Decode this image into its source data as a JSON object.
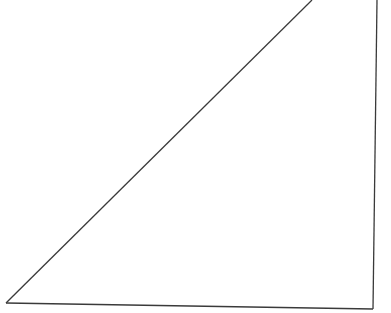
{
  "diagram": {
    "type": "triangle",
    "background": "#ffffff",
    "stroke_color": "#3a3a3a",
    "stroke_width": 1.3,
    "fill": "none",
    "vertices": {
      "apex_clipped_top_left": [
        312,
        0
      ],
      "apex_clipped_top_right": [
        377,
        0
      ],
      "bottom_left": [
        6,
        303
      ],
      "bottom_right": [
        373,
        309
      ]
    }
  }
}
